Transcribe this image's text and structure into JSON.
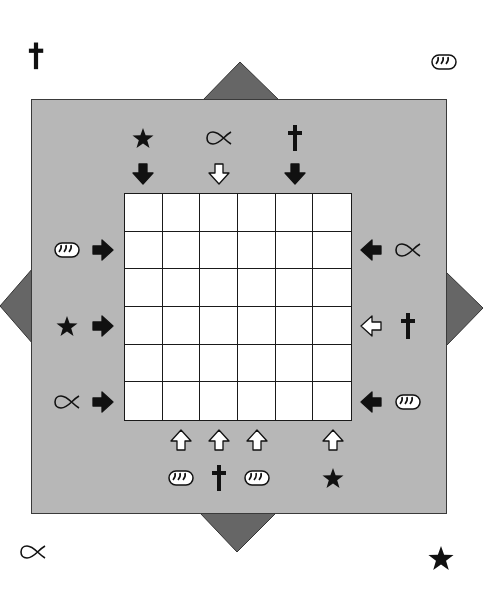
{
  "puzzle": {
    "title": "",
    "grid": {
      "rows": 6,
      "cols": 6
    },
    "colors": {
      "panel": "#b7b7b7",
      "corner_triangle": "#666666",
      "grid_bg": "#ffffff",
      "ink": "#111111"
    },
    "corner_symbols": {
      "top_left": "cross",
      "top_right": "bread",
      "bottom_left": "fish",
      "bottom_right": "star"
    },
    "clues": {
      "top": [
        {
          "col": 1,
          "symbol": "star",
          "arrow": "down",
          "arrow_fill": "black"
        },
        {
          "col": 3,
          "symbol": "fish",
          "arrow": "down",
          "arrow_fill": "white"
        },
        {
          "col": 5,
          "symbol": "cross",
          "arrow": "down",
          "arrow_fill": "black"
        }
      ],
      "left": [
        {
          "row": 2,
          "symbol": "bread",
          "arrow": "right",
          "arrow_fill": "black"
        },
        {
          "row": 4,
          "symbol": "star",
          "arrow": "right",
          "arrow_fill": "black"
        },
        {
          "row": 6,
          "symbol": "fish",
          "arrow": "right",
          "arrow_fill": "black"
        }
      ],
      "right": [
        {
          "row": 2,
          "symbol": "fish",
          "arrow": "left",
          "arrow_fill": "black"
        },
        {
          "row": 4,
          "symbol": "cross",
          "arrow": "left",
          "arrow_fill": "white"
        },
        {
          "row": 6,
          "symbol": "bread",
          "arrow": "left",
          "arrow_fill": "black"
        }
      ],
      "bottom": [
        {
          "col": 2,
          "symbol": "bread",
          "arrow": "up",
          "arrow_fill": "white"
        },
        {
          "col": 3,
          "symbol": "cross",
          "arrow": "up",
          "arrow_fill": "white"
        },
        {
          "col": 4,
          "symbol": "bread",
          "arrow": "up",
          "arrow_fill": "white"
        },
        {
          "col": 6,
          "symbol": "star",
          "arrow": "up",
          "arrow_fill": "white"
        }
      ]
    },
    "cells": [
      [
        "",
        "",
        "",
        "",
        "",
        ""
      ],
      [
        "",
        "",
        "",
        "",
        "",
        ""
      ],
      [
        "",
        "",
        "",
        "",
        "",
        ""
      ],
      [
        "",
        "",
        "",
        "",
        "",
        ""
      ],
      [
        "",
        "",
        "",
        "",
        "",
        ""
      ],
      [
        "",
        "",
        "",
        "",
        "",
        ""
      ]
    ]
  }
}
